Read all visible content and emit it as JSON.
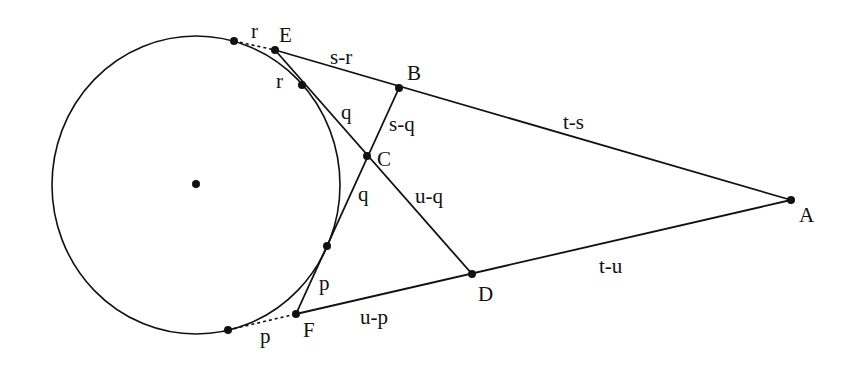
{
  "diagram": {
    "colors": {
      "stroke": "#111111",
      "background": "#ffffff"
    },
    "circle": {
      "cx": 196,
      "cy": 185,
      "rx": 144,
      "ry": 149
    },
    "points": {
      "A": {
        "label": "A",
        "x": 791,
        "y": 200
      },
      "B": {
        "label": "B",
        "x": 399,
        "y": 88
      },
      "C": {
        "label": "C",
        "x": 367,
        "y": 156
      },
      "D": {
        "label": "D",
        "x": 472,
        "y": 274
      },
      "E": {
        "label": "E",
        "x": 275,
        "y": 50
      },
      "F": {
        "label": "F",
        "x": 296,
        "y": 314
      }
    },
    "segment_labels": {
      "r_top": "r",
      "s_minus_r": "s-r",
      "r_inner": "r",
      "q_upper": "q",
      "s_minus_q": "s-q",
      "t_minus_s": "t-s",
      "q_lower": "q",
      "u_minus_q": "u-q",
      "p_inner": "p",
      "t_minus_u": "t-u",
      "u_minus_p": "u-p",
      "p_bottom": "p"
    }
  }
}
